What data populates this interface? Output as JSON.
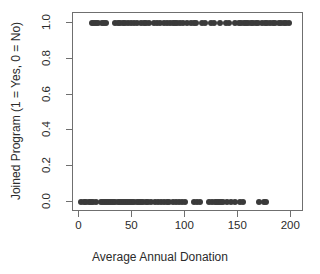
{
  "chart_data": {
    "type": "scatter",
    "title": "",
    "xlabel": "Average Annual Donation",
    "ylabel": "Joined Program (1 = Yes, 0 = No)",
    "xlim": [
      -6,
      212
    ],
    "ylim": [
      -0.055,
      1.055
    ],
    "xticks": [
      0,
      50,
      100,
      150,
      200
    ],
    "xtick_labels": [
      "0",
      "50",
      "100",
      "150",
      "200"
    ],
    "yticks": [
      0.0,
      0.2,
      0.4,
      0.6,
      0.8,
      1.0
    ],
    "ytick_labels": [
      "0.0",
      "0.2",
      "0.4",
      "0.6",
      "0.8",
      "1.0"
    ],
    "grid": false,
    "legend": null,
    "marker": {
      "shape": "circle",
      "filled": true,
      "color": "#3a3a3a",
      "size_px": 6
    },
    "series": [
      {
        "name": "Joined = 1 (Yes)",
        "y_value": 1,
        "x": [
          12,
          14,
          16,
          18,
          21,
          23,
          25,
          34,
          36,
          38,
          41,
          43,
          46,
          49,
          52,
          54,
          58,
          61,
          63,
          66,
          70,
          73,
          76,
          80,
          83,
          86,
          88,
          90,
          92,
          95,
          98,
          102,
          105,
          108,
          110,
          116,
          119,
          124,
          127,
          133,
          138,
          141,
          147,
          151,
          153,
          155,
          157,
          159,
          162,
          164,
          167,
          169,
          172,
          175,
          177,
          180,
          183,
          185,
          188,
          190,
          193,
          195,
          198
        ]
      },
      {
        "name": "Joined = 0 (No)",
        "y_value": 0,
        "x": [
          2,
          4,
          6,
          9,
          11,
          13,
          16,
          20,
          22,
          24,
          26,
          28,
          30,
          32,
          34,
          36,
          38,
          40,
          42,
          44,
          46,
          48,
          50,
          52,
          54,
          56,
          58,
          60,
          63,
          65,
          68,
          71,
          74,
          77,
          80,
          83,
          85,
          88,
          91,
          94,
          97,
          100,
          108,
          111,
          114,
          122,
          125,
          128,
          130,
          132,
          134,
          136,
          139,
          143,
          147,
          152,
          154,
          170,
          174,
          176
        ]
      }
    ]
  }
}
